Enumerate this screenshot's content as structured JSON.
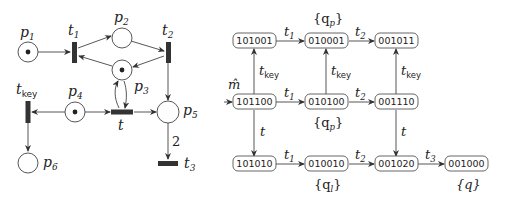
{
  "petri_net": {
    "places": [
      {
        "id": "p1",
        "label": "p",
        "sub": "1",
        "token": true
      },
      {
        "id": "p2",
        "label": "p",
        "sub": "2",
        "token": false
      },
      {
        "id": "p3",
        "label": "p",
        "sub": "3",
        "token": true
      },
      {
        "id": "p4",
        "label": "p",
        "sub": "4",
        "token": true
      },
      {
        "id": "p5",
        "label": "p",
        "sub": "5",
        "token": false
      },
      {
        "id": "p6",
        "label": "p",
        "sub": "6",
        "token": false
      }
    ],
    "transitions": [
      {
        "id": "t1",
        "label": "t",
        "sub": "1"
      },
      {
        "id": "t2",
        "label": "t",
        "sub": "2"
      },
      {
        "id": "t",
        "label": "t",
        "sub": ""
      },
      {
        "id": "tkey",
        "label": "t",
        "sub": "key"
      },
      {
        "id": "t3",
        "label": "t",
        "sub": "3"
      }
    ],
    "arc_weight_p5_t3": "2"
  },
  "reachability_graph": {
    "initial_marker": "m̂",
    "nodes": {
      "n101001": "101001",
      "n010001": "010001",
      "n001011": "001011",
      "n101100": "101100",
      "n010100": "010100",
      "n001110": "001110",
      "n101010": "101010",
      "n010010": "010010",
      "n001020": "001020",
      "n001000": "001000"
    },
    "edge_labels": {
      "t1": "t",
      "t1_sub": "1",
      "t2": "t",
      "t2_sub": "2",
      "t3": "t",
      "t3_sub": "3",
      "t": "t",
      "tkey": "t",
      "tkey_sub": "key"
    },
    "annotations": {
      "qp_top": "{q",
      "qp_top_sub": "p",
      "qp_mid": "{q",
      "qp_mid_sub": "p",
      "ql": "{q",
      "ql_sub": "l",
      "q": "{q}",
      "close": "}"
    }
  }
}
